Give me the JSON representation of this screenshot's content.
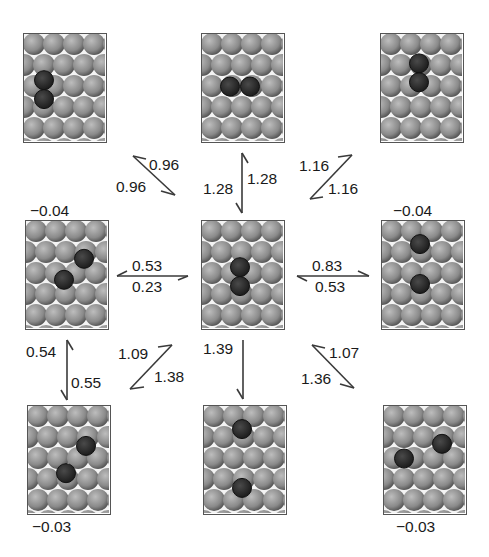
{
  "figure": {
    "panels": [
      {
        "id": "top-left",
        "row": 0,
        "col": 0,
        "energy_label": "",
        "atoms": [
          [
            1,
            2.2
          ],
          [
            1,
            3.1
          ]
        ]
      },
      {
        "id": "top-center",
        "row": 0,
        "col": 1,
        "energy_label": "",
        "atoms": [
          [
            1.4,
            2.5
          ],
          [
            2.4,
            2.5
          ]
        ]
      },
      {
        "id": "top-right",
        "row": 0,
        "col": 2,
        "energy_label": "",
        "atoms": [
          [
            1.9,
            1.4
          ],
          [
            1.9,
            2.3
          ]
        ]
      },
      {
        "id": "middle-left",
        "row": 1,
        "col": 0,
        "energy_label": "−0.04",
        "atoms": [
          [
            2.9,
            1.8
          ],
          [
            1.9,
            2.8
          ]
        ]
      },
      {
        "id": "middle-center",
        "row": 1,
        "col": 1,
        "energy_label": "",
        "atoms": [
          [
            1.9,
            2.2
          ],
          [
            1.9,
            3.1
          ]
        ]
      },
      {
        "id": "middle-right",
        "row": 1,
        "col": 2,
        "energy_label": "−0.04",
        "atoms": [
          [
            1.9,
            1.1
          ],
          [
            1.9,
            3.0
          ]
        ]
      },
      {
        "id": "bottom-left",
        "row": 2,
        "col": 0,
        "energy_label": "−0.03",
        "atoms": [
          [
            2.9,
            1.9
          ],
          [
            1.9,
            3.2
          ]
        ]
      },
      {
        "id": "bottom-center",
        "row": 2,
        "col": 1,
        "energy_label": "",
        "atoms": [
          [
            1.9,
            1.1
          ],
          [
            1.9,
            3.9
          ]
        ]
      },
      {
        "id": "bottom-right",
        "row": 2,
        "col": 2,
        "energy_label": "−0.03",
        "atoms": [
          [
            2.9,
            1.8
          ],
          [
            1.0,
            2.5
          ]
        ]
      }
    ],
    "barriers": {
      "center_to_topleft": "0.96",
      "topleft_to_center": "0.96",
      "center_to_top": "1.28",
      "top_to_center": "1.28",
      "topright_to_center": "1.16",
      "center_to_topright": "1.16",
      "left_to_center": "0.53",
      "center_to_left": "0.23",
      "center_to_right": "0.83",
      "right_to_center": "0.53",
      "bottomleft_to_left": "0.54",
      "left_to_bottomleft": "0.55",
      "bottomleft_up": "1.09",
      "center_to_bottomleft": "1.38",
      "center_to_bottom": "1.39",
      "bottomright_to_center": "1.07",
      "center_to_bottomright": "1.36"
    }
  },
  "colors": {
    "atom_light": "#bdbdbd",
    "atom_mid": "#8a8a8a",
    "atom_dark": "#5a5a5a",
    "adsorbate": "#1e1e1e",
    "arrow": "#3a3a3a",
    "border": "#555555"
  }
}
